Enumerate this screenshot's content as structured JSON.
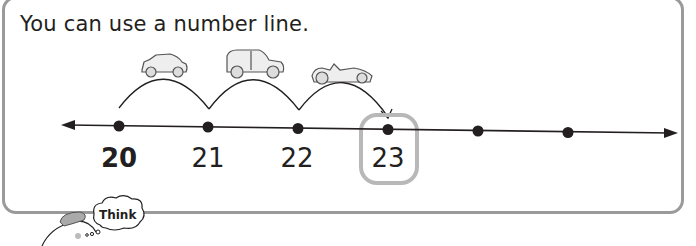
{
  "heading": "You can use a number line.",
  "number_line": {
    "labels": [
      {
        "value": "20",
        "bold": true
      },
      {
        "value": "21",
        "bold": false
      },
      {
        "value": "22",
        "bold": false
      },
      {
        "value": "23",
        "bold": false,
        "highlighted": true
      }
    ],
    "tick_count": 6,
    "jumps": 3,
    "vehicles": [
      "small-car-icon",
      "hatchback-car-icon",
      "race-car-icon"
    ],
    "highlight_color": "#b8b8b8"
  },
  "think_bubble": {
    "label": "Think"
  },
  "colors": {
    "border": "#9a9a9a",
    "text": "#231f20"
  }
}
